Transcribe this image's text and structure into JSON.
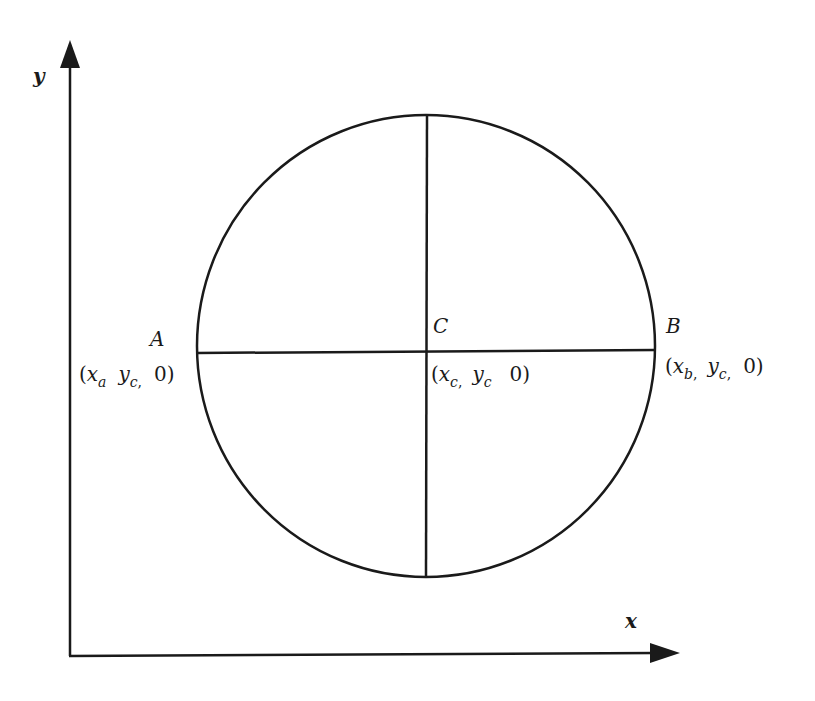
{
  "diagram": {
    "type": "geometry",
    "colors": {
      "stroke": "#1a1a1a",
      "background": "#ffffff"
    },
    "axes": {
      "x_label": "x",
      "y_label": "y"
    },
    "circle": {
      "center": {
        "x": 426,
        "y": 346
      },
      "rx": 229,
      "ry": 231
    },
    "points": {
      "A": {
        "label": "A",
        "coord_open": "(",
        "coord_x": "x",
        "coord_x_sub": "a",
        "coord_y": "y",
        "coord_y_sub": "c",
        "coord_z": "0)"
      },
      "C": {
        "label": "C",
        "coord_open": "(",
        "coord_x": "x",
        "coord_x_sub": "c",
        "coord_y": "y",
        "coord_y_sub": "c",
        "coord_z": "0)"
      },
      "B": {
        "label": "B",
        "coord_open": "(",
        "coord_x": "x",
        "coord_x_sub": "b",
        "coord_y": "y",
        "coord_y_sub": "c",
        "coord_z": "0)"
      }
    }
  }
}
